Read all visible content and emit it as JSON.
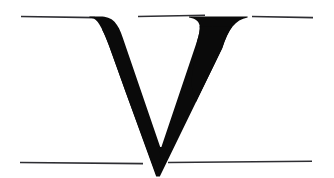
{
  "canvas": {
    "width": 334,
    "height": 178,
    "background_color": "#ffffff",
    "description": "Printed serif capital letter specimen on ruled guide lines"
  },
  "glyph": {
    "character": "V",
    "name": "capital-letter-v",
    "style": "serif",
    "fill_color": "#0a0a0a",
    "bounding_box": {
      "x": 98,
      "y": 16,
      "width": 150,
      "height": 160
    },
    "apex_tip": {
      "x": 156,
      "y": 176
    },
    "thick_stroke": "left-diagonal",
    "thin_stroke": "right-diagonal",
    "top_serif_left": {
      "x_start": 98,
      "x_end": 137
    },
    "top_serif_right": {
      "x_start": 207,
      "x_end": 248
    }
  },
  "guide_lines": {
    "color": "#2e2e33",
    "thickness": 1.6,
    "top_rule": {
      "name": "cap-height-rule",
      "y": 16.5,
      "segments": [
        {
          "x_start": 21,
          "x_end": 95
        },
        {
          "x_start": 138,
          "x_end": 205
        },
        {
          "x_start": 252,
          "x_end": 313
        }
      ]
    },
    "bottom_rule": {
      "name": "baseline-rule",
      "y": 162.5,
      "segments": [
        {
          "x_start": 20,
          "x_end": 143
        },
        {
          "x_start": 168,
          "x_end": 312
        }
      ]
    }
  },
  "labels": {
    "title": "V",
    "caption": ""
  }
}
